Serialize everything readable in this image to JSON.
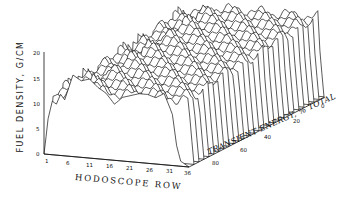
{
  "chart_data": {
    "type": "waterfall-3d-line",
    "title": "",
    "ylabel": "FUEL DENSITY, G/CM",
    "xlabel": "HODOSCOPE ROW",
    "zlabel": "TRANSIENT ENERGY, % TOTAL",
    "y_ticks": [
      "0",
      "5",
      "10",
      "15",
      "20"
    ],
    "x_ticks": [
      "1",
      "6",
      "11",
      "16",
      "21",
      "26",
      "31",
      "36"
    ],
    "z_ticks": [
      "0",
      "20",
      "40",
      "60",
      "80"
    ],
    "ylim": [
      0,
      20
    ],
    "xlim": [
      1,
      36
    ],
    "zlim": [
      0,
      90
    ],
    "grid": false,
    "legend": null,
    "front_profile": {
      "x": [
        1,
        2,
        3,
        4,
        5,
        6,
        8,
        10,
        12,
        14,
        16,
        18,
        20,
        22,
        24,
        26,
        28,
        30,
        32,
        33,
        34,
        35,
        36
      ],
      "y": [
        0,
        7,
        10.5,
        10,
        12,
        11,
        16,
        15,
        15.5,
        14,
        13,
        11,
        12.5,
        13,
        13.5,
        13.5,
        13,
        14,
        10,
        4,
        1,
        0.5,
        0
      ]
    },
    "n_profiles": 28
  },
  "labels": {
    "ylabel": "FUEL DENSITY, G/CM",
    "xlabel": "HODOSCOPE ROW",
    "zlabel": "TRANSIENT ENERGY, % TOTAL"
  },
  "ticks": {
    "y": [
      "0",
      "5",
      "10",
      "15",
      "20"
    ],
    "x": [
      "1",
      "6",
      "11",
      "16",
      "21",
      "26",
      "31",
      "36"
    ],
    "z": [
      "0",
      "20",
      "40",
      "60",
      "80"
    ]
  },
  "colors": {
    "line": "#111111",
    "background": "#ffffff"
  }
}
